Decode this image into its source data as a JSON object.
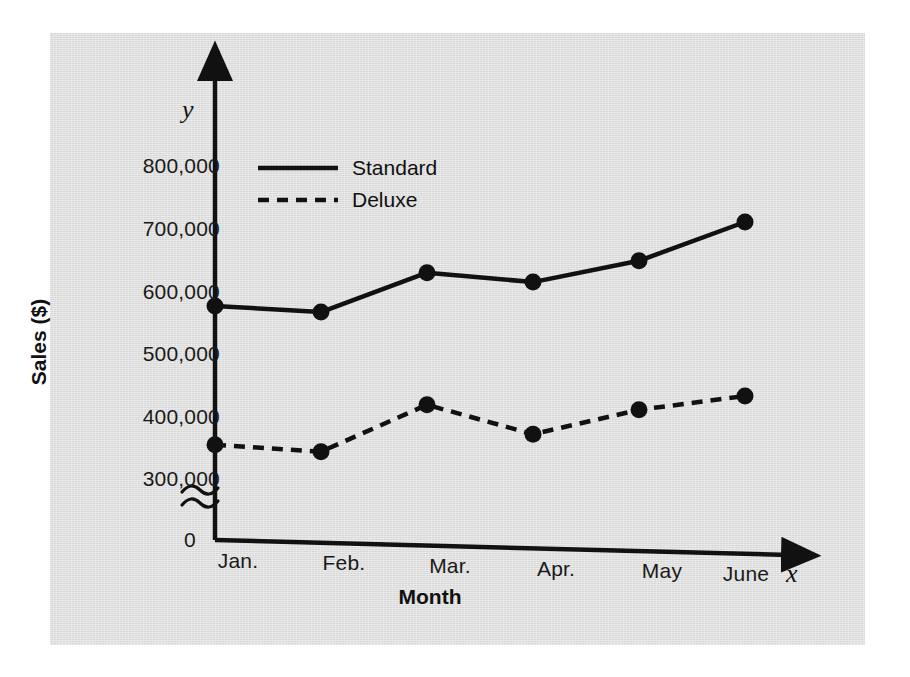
{
  "chart_data": {
    "type": "line",
    "title": "",
    "xlabel": "Month",
    "ylabel": "Sales ($)",
    "x_axis_variable": "x",
    "y_axis_variable": "y",
    "origin_label": "0",
    "axis_break": true,
    "grid": false,
    "legend_position": "top-left-inside",
    "categories": [
      "Jan.",
      "Feb.",
      "Mar.",
      "Apr.",
      "May",
      "June"
    ],
    "ytick_labels": [
      "800,000",
      "700,000",
      "600,000",
      "500,000",
      "400,000",
      "300,000"
    ],
    "ytick_values": [
      800000,
      700000,
      600000,
      500000,
      400000,
      300000
    ],
    "ylim": [
      300000,
      800000
    ],
    "series": [
      {
        "name": "Standard",
        "style": "solid",
        "marker": "filled-circle",
        "color": "#111111",
        "values": [
          575000,
          565000,
          628000,
          613000,
          647000,
          709000
        ]
      },
      {
        "name": "Deluxe",
        "style": "dashed",
        "marker": "filled-circle",
        "color": "#111111",
        "values": [
          353000,
          342000,
          417000,
          370000,
          409000,
          431000
        ]
      }
    ]
  },
  "figure": {
    "panel_color": "#dedede",
    "background_color": "#ffffff",
    "ink_color": "#111111"
  }
}
